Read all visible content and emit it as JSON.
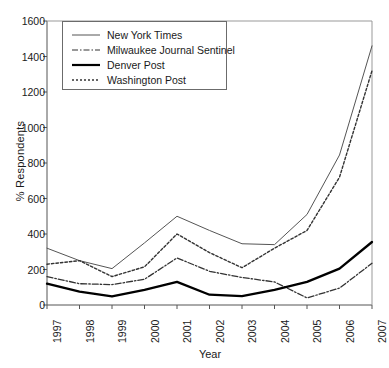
{
  "chart_data": {
    "type": "line",
    "title": "",
    "xlabel": "Year",
    "ylabel": "% Respondents",
    "categories": [
      "1997",
      "1998",
      "1999",
      "2000",
      "2001",
      "2002",
      "2003",
      "2004",
      "2005",
      "2006",
      "2007"
    ],
    "x": [
      1997,
      1998,
      1999,
      2000,
      2001,
      2002,
      2003,
      2004,
      2005,
      2006,
      2007
    ],
    "xlim": [
      1997,
      2007
    ],
    "ylim": [
      0,
      1600
    ],
    "yticks": [
      0,
      200,
      400,
      600,
      800,
      1000,
      1200,
      1400,
      1600
    ],
    "ytick_labels": [
      "0",
      "200",
      "400",
      "600",
      "800",
      "1000",
      "1200",
      "1400",
      "1600"
    ],
    "grid": false,
    "legend_position": "upper-left",
    "series": [
      {
        "name": "New York Times",
        "style": "solid-thin",
        "color": "#555555",
        "values": [
          320,
          250,
          205,
          350,
          500,
          420,
          345,
          340,
          510,
          845,
          1460
        ]
      },
      {
        "name": "Milwaukee Journal Sentinel",
        "style": "dash-dot",
        "color": "#333333",
        "values": [
          160,
          120,
          115,
          145,
          265,
          190,
          155,
          130,
          40,
          95,
          235
        ]
      },
      {
        "name": "Denver Post",
        "style": "solid-thick",
        "color": "#000000",
        "values": [
          120,
          75,
          48,
          85,
          130,
          58,
          50,
          85,
          130,
          205,
          355
        ]
      },
      {
        "name": "Washington Post",
        "style": "dotted",
        "color": "#333333",
        "values": [
          230,
          250,
          160,
          215,
          400,
          295,
          210,
          320,
          420,
          720,
          1320
        ]
      }
    ]
  },
  "legend": {
    "items": [
      {
        "label": "New York Times"
      },
      {
        "label": "Milwaukee Journal Sentinel"
      },
      {
        "label": "Denver Post"
      },
      {
        "label": "Washington Post"
      }
    ]
  }
}
